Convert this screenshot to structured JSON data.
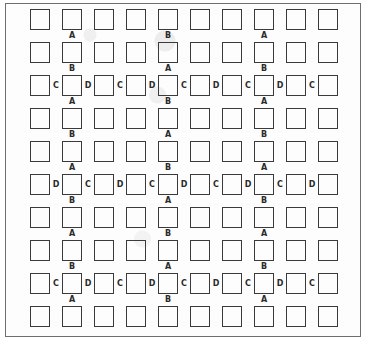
{
  "diagram": {
    "rows": 10,
    "cols": 10,
    "layout": {
      "origin_x": 30,
      "origin_y": 9,
      "col_pitch": 32,
      "row_pitch": 33,
      "cell_w": 20,
      "cell_h": 21
    },
    "colors": {
      "border": "#3a3a3a",
      "frame": "#6e6e6e",
      "label": "#2a2a2a",
      "background": "#ffffff"
    },
    "below_label_columns": [
      1,
      4,
      7
    ],
    "below_labels": [
      [
        "A",
        "B",
        "A"
      ],
      [
        "B",
        "A",
        "B"
      ],
      [
        "A",
        "B",
        "A"
      ],
      [
        "B",
        "A",
        "B"
      ],
      [
        "A",
        "B",
        "A"
      ],
      [
        "B",
        "A",
        "B"
      ],
      [
        "A",
        "B",
        "A"
      ],
      [
        "B",
        "A",
        "B"
      ],
      [
        "A",
        "B",
        "A"
      ],
      []
    ],
    "between_labels": {
      "2": [
        "C",
        "D",
        "C",
        "D",
        "C",
        "D",
        "C",
        "D",
        "C"
      ],
      "5": [
        "D",
        "C",
        "D",
        "C",
        "D",
        "C",
        "D",
        "C",
        "D"
      ],
      "8": [
        "C",
        "D",
        "C",
        "D",
        "C",
        "D",
        "C",
        "D",
        "C"
      ]
    }
  }
}
